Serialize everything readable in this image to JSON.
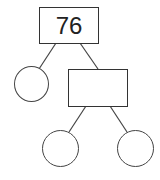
{
  "diagram": {
    "type": "number-bond-tree",
    "root": {
      "value": "76"
    },
    "level1": {
      "left_circle": "",
      "right_box": ""
    },
    "level2": {
      "left_circle": "",
      "right_circle": ""
    }
  },
  "colors": {
    "stroke": "#333333",
    "background": "#ffffff"
  }
}
